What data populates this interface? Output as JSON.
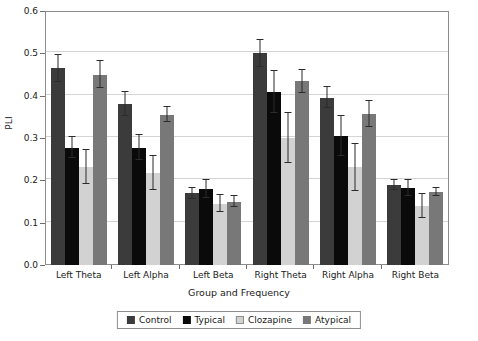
{
  "chart_data": {
    "type": "bar",
    "title": "",
    "xlabel": "Group and Frequency",
    "ylabel": "PLI",
    "ylim": [
      0.0,
      0.6
    ],
    "yticks": [
      "0.0",
      "0.1",
      "0.2",
      "0.3",
      "0.4",
      "0.5",
      "0.6"
    ],
    "grid": true,
    "legend_position": "bottom",
    "categories": [
      "Left Theta",
      "Left Alpha",
      "Left Beta",
      "Right Theta",
      "Right Alpha",
      "Right  Beta"
    ],
    "series": [
      {
        "name": "Control",
        "color": "#3b3b3b",
        "values": [
          0.465,
          0.38,
          0.17,
          0.5,
          0.395,
          0.19
        ],
        "errors": [
          0.032,
          0.028,
          0.013,
          0.032,
          0.025,
          0.012
        ]
      },
      {
        "name": "Typical",
        "color": "#0a0a0a",
        "values": [
          0.277,
          0.277,
          0.18,
          0.408,
          0.305,
          0.182
        ],
        "errors": [
          0.025,
          0.03,
          0.022,
          0.05,
          0.048,
          0.018
        ]
      },
      {
        "name": "Clozapine",
        "color": "#d2d2d2",
        "values": [
          0.231,
          0.218,
          0.145,
          0.3,
          0.231,
          0.14
        ],
        "errors": [
          0.04,
          0.04,
          0.02,
          0.058,
          0.055,
          0.028
        ]
      },
      {
        "name": "Atypical",
        "color": "#787878",
        "values": [
          0.45,
          0.355,
          0.15,
          0.434,
          0.357,
          0.173
        ],
        "errors": [
          0.033,
          0.018,
          0.012,
          0.027,
          0.03,
          0.01
        ]
      }
    ]
  },
  "legend": {
    "items": [
      {
        "label": "Control"
      },
      {
        "label": "Typical"
      },
      {
        "label": "Clozapine"
      },
      {
        "label": "Atypical"
      }
    ]
  },
  "axes": {
    "y_title": "PLI",
    "x_title": "Group and Frequency"
  }
}
